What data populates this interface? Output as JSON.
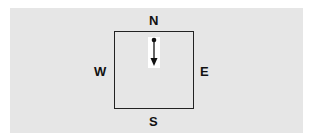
{
  "diagram": {
    "labels": {
      "north": "N",
      "south": "S",
      "west": "W",
      "east": "E"
    },
    "arrow": {
      "direction": "down",
      "description": "vector pointing south from a dot near the north edge"
    },
    "colors": {
      "background": "#e6e6e6",
      "lines": "#222222",
      "highlight": "#ffffff"
    }
  }
}
